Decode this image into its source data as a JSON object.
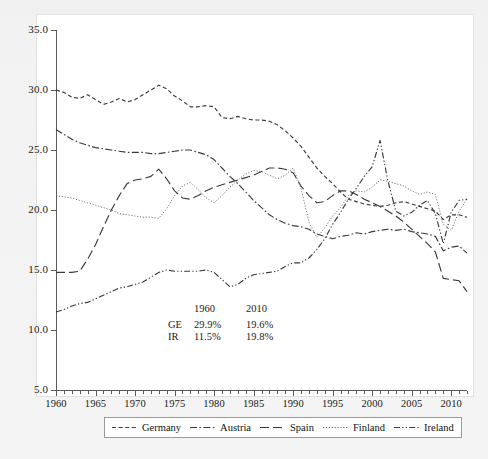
{
  "chart_data": {
    "type": "line",
    "title": "",
    "subtitle": "",
    "xlabel": "",
    "ylabel": "",
    "xlim": [
      1960,
      2012
    ],
    "ylim": [
      5.0,
      35.0
    ],
    "grid": false,
    "legend_position": "bottom",
    "y_ticks": [
      "35.0",
      "30.0",
      "25.0",
      "20.0",
      "15.0",
      "10.0",
      "5.0"
    ],
    "y_tick_values": [
      35.0,
      30.0,
      25.0,
      20.0,
      15.0,
      10.0,
      5.0
    ],
    "x_ticks": [
      "1960",
      "1965",
      "1970",
      "1975",
      "1980",
      "1985",
      "1990",
      "1995",
      "2000",
      "2005",
      "2010"
    ],
    "x_tick_values": [
      1960,
      1965,
      1970,
      1975,
      1980,
      1985,
      1990,
      1995,
      2000,
      2005,
      2010
    ],
    "x": [
      1960,
      1961,
      1962,
      1963,
      1964,
      1965,
      1966,
      1967,
      1968,
      1969,
      1970,
      1971,
      1972,
      1973,
      1974,
      1975,
      1976,
      1977,
      1978,
      1979,
      1980,
      1981,
      1982,
      1983,
      1984,
      1985,
      1986,
      1987,
      1988,
      1989,
      1990,
      1991,
      1992,
      1993,
      1994,
      1995,
      1996,
      1997,
      1998,
      1999,
      2000,
      2001,
      2002,
      2003,
      2004,
      2005,
      2006,
      2007,
      2008,
      2009,
      2010,
      2011,
      2012
    ],
    "series": [
      {
        "name": "Germany",
        "dash": "dashed",
        "color": "#3a3a3a",
        "values": [
          30.0,
          29.8,
          29.4,
          29.3,
          29.6,
          29.2,
          28.8,
          29.0,
          29.3,
          29.0,
          29.2,
          29.6,
          30.0,
          30.4,
          30.1,
          29.5,
          29.1,
          28.6,
          28.6,
          28.7,
          28.6,
          27.7,
          27.6,
          27.8,
          27.6,
          27.5,
          27.5,
          27.4,
          27.1,
          26.6,
          26.0,
          25.3,
          24.4,
          23.5,
          22.8,
          22.2,
          21.5,
          20.9,
          20.7,
          20.5,
          20.4,
          20.3,
          20.4,
          20.6,
          20.7,
          20.5,
          20.3,
          20.1,
          19.9,
          19.2,
          19.6,
          19.6,
          19.4
        ]
      },
      {
        "name": "Austria",
        "dash": "dash-dot",
        "color": "#3a3a3a",
        "values": [
          26.7,
          26.3,
          25.9,
          25.6,
          25.4,
          25.2,
          25.1,
          25.0,
          24.9,
          24.8,
          24.8,
          24.8,
          24.7,
          24.7,
          24.8,
          24.9,
          25.0,
          25.0,
          24.8,
          24.6,
          24.2,
          23.5,
          22.8,
          22.2,
          21.5,
          20.8,
          20.2,
          19.6,
          19.2,
          18.9,
          18.7,
          18.6,
          18.4,
          18.0,
          17.8,
          17.6,
          17.8,
          17.9,
          18.1,
          18.0,
          18.2,
          18.3,
          18.4,
          18.3,
          18.4,
          18.2,
          18.1,
          18.0,
          17.8,
          16.6,
          16.9,
          17.0,
          16.4
        ]
      },
      {
        "name": "Spain",
        "dash": "long-dash",
        "color": "#3a3a3a",
        "values": [
          14.8,
          14.8,
          14.8,
          14.9,
          15.9,
          17.1,
          18.6,
          20.0,
          21.2,
          22.2,
          22.5,
          22.6,
          22.8,
          23.4,
          22.6,
          21.6,
          21.0,
          20.9,
          21.2,
          21.6,
          21.9,
          22.1,
          22.3,
          22.5,
          22.7,
          22.9,
          23.2,
          23.5,
          23.5,
          23.4,
          23.1,
          22.0,
          21.2,
          20.6,
          20.7,
          21.2,
          21.6,
          21.6,
          21.3,
          20.9,
          20.6,
          20.3,
          19.9,
          19.5,
          19.0,
          18.4,
          17.8,
          17.2,
          16.5,
          14.3,
          14.2,
          14.1,
          13.2
        ]
      },
      {
        "name": "Finland",
        "dash": "dotted",
        "color": "#5a5a5a",
        "values": [
          21.2,
          21.1,
          21.0,
          20.8,
          20.6,
          20.4,
          20.2,
          20.0,
          19.7,
          19.6,
          19.5,
          19.4,
          19.4,
          19.3,
          20.1,
          21.2,
          22.0,
          22.3,
          21.7,
          21.0,
          20.6,
          21.2,
          21.9,
          22.5,
          23.0,
          23.3,
          23.2,
          22.9,
          22.6,
          22.9,
          23.5,
          21.8,
          19.0,
          17.7,
          18.5,
          19.5,
          20.2,
          21.2,
          21.6,
          21.5,
          21.9,
          22.5,
          22.4,
          22.2,
          22.0,
          21.6,
          21.3,
          21.5,
          21.3,
          18.8,
          18.3,
          19.9,
          20.9
        ]
      },
      {
        "name": "Ireland",
        "dash": "dash-dot-dot",
        "color": "#3a3a3a",
        "values": [
          11.5,
          11.7,
          12.0,
          12.2,
          12.3,
          12.6,
          12.9,
          13.2,
          13.5,
          13.6,
          13.8,
          14.0,
          14.4,
          14.8,
          15.0,
          14.9,
          14.9,
          14.9,
          14.9,
          15.0,
          14.8,
          14.2,
          13.6,
          13.8,
          14.3,
          14.6,
          14.7,
          14.8,
          14.9,
          15.3,
          15.6,
          15.6,
          16.0,
          16.7,
          17.6,
          18.8,
          19.8,
          20.9,
          21.8,
          22.8,
          23.6,
          25.8,
          22.4,
          19.9,
          19.5,
          19.8,
          20.4,
          20.8,
          19.7,
          17.2,
          19.8,
          20.8,
          20.9
        ]
      }
    ],
    "annotation": {
      "columns": [
        "",
        "1960",
        "2010"
      ],
      "rows": [
        {
          "label": "GE",
          "v1960": "29.9%",
          "v2010": "19.6%"
        },
        {
          "label": "IR",
          "v1960": "11.5%",
          "v2010": "19.8%"
        }
      ]
    }
  },
  "legend": {
    "entries": [
      {
        "label": "Germany",
        "dash": "dashed"
      },
      {
        "label": "Austria",
        "dash": "dash-dot"
      },
      {
        "label": "Spain",
        "dash": "long-dash"
      },
      {
        "label": "Finland",
        "dash": "dotted"
      },
      {
        "label": "Ireland",
        "dash": "dash-dot-dot"
      }
    ]
  },
  "colors": {
    "page_background": "#f2f2f2",
    "plot_background": "#ffffff",
    "axis": "#5a5a5a",
    "line": "#3a3a3a",
    "text": "#1a1a1a",
    "legend_border": "#9a9a9a"
  }
}
